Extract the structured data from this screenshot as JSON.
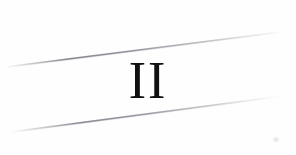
{
  "document": {
    "type": "scanned-page-fragment",
    "background_color": "#ffffff",
    "width": 296,
    "height": 155
  },
  "numeral": {
    "text": "II",
    "meaning": "roman-numeral-two",
    "color": "#111114",
    "style": "serif"
  },
  "rules": [
    {
      "name": "upper-rule",
      "x1": 5,
      "y1": 67,
      "x2": 288,
      "y2": 31,
      "color": "#8e8e96",
      "thickness": 1.5
    },
    {
      "name": "lower-rule",
      "x1": 10,
      "y1": 132,
      "x2": 282,
      "y2": 96,
      "color": "#8e8e96",
      "thickness": 1.5
    }
  ],
  "artifacts": [
    {
      "name": "corner-smudge",
      "x": 275,
      "y": 140,
      "color": "#96969e"
    }
  ]
}
